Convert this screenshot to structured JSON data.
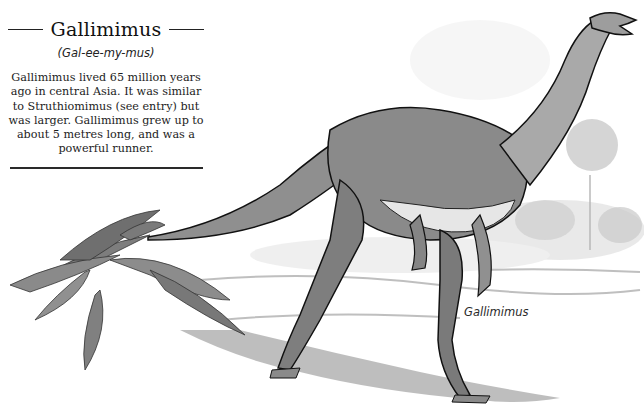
{
  "entry": {
    "title": "Gallimimus",
    "pronunciation": "(Gal-ee-my-mus)",
    "body": "Gallimimus lived 65 million years ago in central Asia. It was similar to Struthiomimus (see entry) but was larger. Gallimimus grew up to about 5 metres long, and was a powerful runner."
  },
  "illustration": {
    "subject": "Gallimimus dinosaur walking",
    "caption": "Gallimimus",
    "elements": [
      "dinosaur",
      "fern-plant",
      "background-trees",
      "ground-shadow"
    ]
  },
  "colors": {
    "ink": "#1a1a1a",
    "wash_dark": "#6e6e6e",
    "wash_mid": "#9a9a9a",
    "wash_light": "#cfcfcf",
    "paper": "#ffffff"
  }
}
